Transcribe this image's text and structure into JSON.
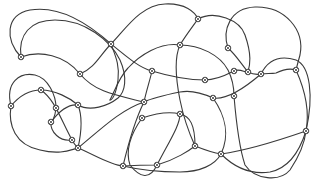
{
  "diagram": {
    "type": "knot-link-diagram",
    "background": "#ffffff",
    "stroke_color": "#3a3a3a",
    "node_style": "circled-crossing",
    "strands": [
      {
        "id": "s1",
        "d": "M21,57 C5,40 5,15 30,10 C60,5 90,25 111,44 C128,58 140,68 152,71 C175,78 195,80 205,80 C218,80 228,74 234,71 C240,68 245,73 248,72"
      },
      {
        "id": "s2",
        "d": "M21,57 C18,35 30,20 55,20 C85,20 110,40 120,60 C128,78 125,92 118,98 C108,106 90,112 78,105"
      },
      {
        "id": "s3",
        "d": "M21,57 C40,50 65,55 80,74 C95,92 115,95 144,102"
      },
      {
        "id": "s4",
        "d": "M80,74 C95,68 100,55 111,44 C125,30 140,5 165,4 C185,3 195,12 198,19"
      },
      {
        "id": "s5",
        "d": "M198,19 C215,10 240,20 245,35 C252,55 250,65 248,72"
      },
      {
        "id": "s6",
        "d": "M198,19 C190,30 184,38 180,45 C174,58 176,80 180,100 C184,120 190,135 195,146"
      },
      {
        "id": "s7",
        "d": "M180,45 C200,45 220,55 228,70 C232,78 234,88 234,96"
      },
      {
        "id": "s8",
        "d": "M180,45 C160,42 140,55 128,68 C120,76 115,90 110,100"
      },
      {
        "id": "s9",
        "d": "M228,48 C222,30 230,8 255,7 C285,6 305,30 300,55 C298,62 297,66 296,70"
      },
      {
        "id": "s10",
        "d": "M228,48 C236,55 242,65 248,72 C252,74 256,75 261,74 C266,73 271,74 276,73 C282,70 290,68 296,70"
      },
      {
        "id": "s11",
        "d": "M261,74 C268,60 280,55 296,60 C310,66 314,95 306,131"
      },
      {
        "id": "s12",
        "d": "M296,70 C305,90 310,110 306,131 C300,150 290,168 270,172 C250,175 235,168 221,154"
      },
      {
        "id": "s13",
        "d": "M234,96 C236,120 240,150 245,165 C255,180 280,182 290,170 C300,155 305,140 306,131"
      },
      {
        "id": "s14",
        "d": "M213,98 C225,100 240,92 261,74"
      },
      {
        "id": "s15",
        "d": "M213,98 C200,92 190,90 180,92 C165,95 152,98 144,102"
      },
      {
        "id": "s16",
        "d": "M213,98 C225,115 230,135 221,154 C215,165 200,172 180,172 C160,172 140,170 123,166"
      },
      {
        "id": "s17",
        "d": "M144,102 C135,120 128,145 123,166"
      },
      {
        "id": "s18",
        "d": "M142,118 C160,112 172,112 180,114 C190,116 195,125 195,146"
      },
      {
        "id": "s19",
        "d": "M142,118 C130,135 125,150 130,165 C140,178 150,180 157,165"
      },
      {
        "id": "s20",
        "d": "M11,106 C20,95 30,90 41,90 C55,90 70,98 78,105"
      },
      {
        "id": "s21",
        "d": "M11,106 C5,82 20,72 35,75 C48,78 56,95 56,108"
      },
      {
        "id": "s22",
        "d": "M11,106 C8,125 15,145 40,150 C60,155 70,150 78,148"
      },
      {
        "id": "s23",
        "d": "M41,90 C55,100 60,118 72,140 C74,144 76,146 78,148"
      },
      {
        "id": "s24",
        "d": "M56,108 C55,118 52,122 51,122 C50,132 60,142 72,140"
      },
      {
        "id": "s25",
        "d": "M51,122 C60,110 70,104 78,105 C82,115 82,130 78,148"
      },
      {
        "id": "s26",
        "d": "M78,148 C100,130 120,110 144,102"
      },
      {
        "id": "s27",
        "d": "M78,148 C95,155 110,165 123,166"
      },
      {
        "id": "s28",
        "d": "M123,166 C140,165 150,165 157,165 C175,160 190,150 195,146"
      },
      {
        "id": "s29",
        "d": "M195,146 C205,150 214,153 221,154 C250,150 280,140 306,131"
      },
      {
        "id": "s30",
        "d": "M157,165 C170,140 180,125 180,114"
      },
      {
        "id": "s31",
        "d": "M152,71 C150,80 146,92 144,102"
      },
      {
        "id": "s32",
        "d": "M111,44 C115,55 120,65 118,80 C116,95 112,100 110,100"
      }
    ],
    "nodes": [
      {
        "id": "n1",
        "x": 21,
        "y": 57
      },
      {
        "id": "n2",
        "x": 80,
        "y": 74
      },
      {
        "id": "n3",
        "x": 111,
        "y": 44
      },
      {
        "id": "n4",
        "x": 152,
        "y": 71
      },
      {
        "id": "n5",
        "x": 198,
        "y": 19
      },
      {
        "id": "n6",
        "x": 180,
        "y": 45
      },
      {
        "id": "n7",
        "x": 228,
        "y": 48
      },
      {
        "id": "n8",
        "x": 248,
        "y": 72
      },
      {
        "id": "n9",
        "x": 234,
        "y": 71
      },
      {
        "id": "n10",
        "x": 261,
        "y": 74
      },
      {
        "id": "n11",
        "x": 296,
        "y": 70
      },
      {
        "id": "n12",
        "x": 205,
        "y": 80
      },
      {
        "id": "n13",
        "x": 213,
        "y": 98
      },
      {
        "id": "n14",
        "x": 234,
        "y": 96
      },
      {
        "id": "n15",
        "x": 11,
        "y": 106
      },
      {
        "id": "n16",
        "x": 41,
        "y": 90
      },
      {
        "id": "n17",
        "x": 56,
        "y": 108
      },
      {
        "id": "n18",
        "x": 51,
        "y": 122
      },
      {
        "id": "n19",
        "x": 78,
        "y": 105
      },
      {
        "id": "n20",
        "x": 72,
        "y": 140
      },
      {
        "id": "n21",
        "x": 78,
        "y": 148
      },
      {
        "id": "n22",
        "x": 144,
        "y": 102
      },
      {
        "id": "n23",
        "x": 142,
        "y": 118
      },
      {
        "id": "n24",
        "x": 180,
        "y": 114
      },
      {
        "id": "n25",
        "x": 195,
        "y": 146
      },
      {
        "id": "n26",
        "x": 157,
        "y": 165
      },
      {
        "id": "n27",
        "x": 123,
        "y": 166
      },
      {
        "id": "n28",
        "x": 221,
        "y": 154
      },
      {
        "id": "n29",
        "x": 306,
        "y": 131
      }
    ]
  }
}
